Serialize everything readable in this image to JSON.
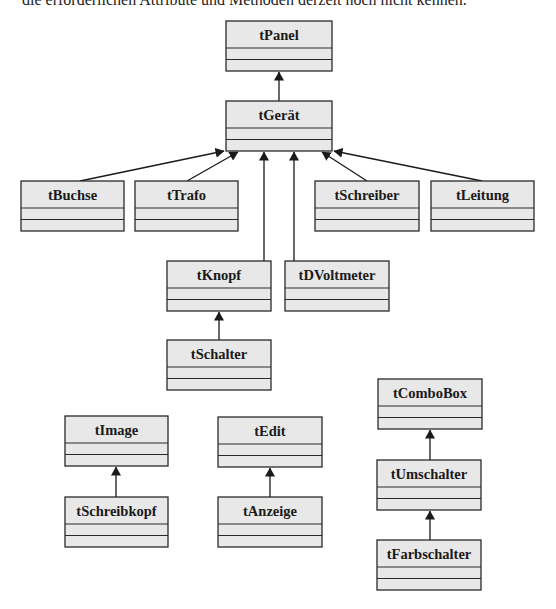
{
  "document": {
    "intro_text": "die erforderlichen Attribute und Methoden derzeit noch nicht kennen."
  },
  "diagram": {
    "type": "uml-class-hierarchy",
    "classes": [
      {
        "id": "tPanel",
        "label": "tPanel"
      },
      {
        "id": "tGeraet",
        "label": "tGerät"
      },
      {
        "id": "tBuchse",
        "label": "tBuchse"
      },
      {
        "id": "tTrafo",
        "label": "tTrafo"
      },
      {
        "id": "tSchreiber",
        "label": "tSchreiber"
      },
      {
        "id": "tLeitung",
        "label": "tLeitung"
      },
      {
        "id": "tKnopf",
        "label": "tKnopf"
      },
      {
        "id": "tDVoltmeter",
        "label": "tDVoltmeter"
      },
      {
        "id": "tSchalter",
        "label": "tSchalter"
      },
      {
        "id": "tImage",
        "label": "tImage"
      },
      {
        "id": "tSchreibkopf",
        "label": "tSchreibkopf"
      },
      {
        "id": "tEdit",
        "label": "tEdit"
      },
      {
        "id": "tAnzeige",
        "label": "tAnzeige"
      },
      {
        "id": "tComboBox",
        "label": "tComboBox"
      },
      {
        "id": "tUmschalter",
        "label": "tUmschalter"
      },
      {
        "id": "tFarbschalter",
        "label": "tFarbschalter"
      }
    ],
    "inheritance": [
      {
        "child": "tGerät",
        "parent": "tPanel"
      },
      {
        "child": "tBuchse",
        "parent": "tGerät"
      },
      {
        "child": "tTrafo",
        "parent": "tGerät"
      },
      {
        "child": "tKnopf",
        "parent": "tGerät"
      },
      {
        "child": "tDVoltmeter",
        "parent": "tGerät"
      },
      {
        "child": "tSchreiber",
        "parent": "tGerät"
      },
      {
        "child": "tLeitung",
        "parent": "tGerät"
      },
      {
        "child": "tSchalter",
        "parent": "tKnopf"
      },
      {
        "child": "tSchreibkopf",
        "parent": "tImage"
      },
      {
        "child": "tAnzeige",
        "parent": "tEdit"
      },
      {
        "child": "tUmschalter",
        "parent": "tComboBox"
      },
      {
        "child": "tFarbschalter",
        "parent": "tUmschalter"
      }
    ],
    "colors": {
      "box_fill": "#e8e8e8",
      "box_stroke": "#2a2a2a",
      "edge": "#1a1a1a"
    }
  }
}
